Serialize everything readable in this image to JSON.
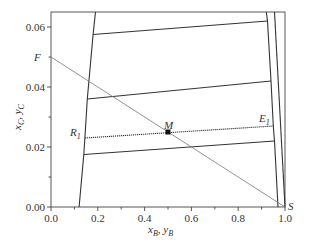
{
  "chart_data": {
    "type": "line",
    "title": "",
    "xlabel": "x_B, y_B",
    "ylabel": "x_C, y_C",
    "xlim": [
      0.0,
      1.0
    ],
    "ylim": [
      0.0,
      0.065
    ],
    "x_ticks": [
      "0.0",
      "0.2",
      "0.4",
      "0.6",
      "0.8",
      "1.0"
    ],
    "y_ticks": [
      "0.00",
      "0.02",
      "0.04",
      "0.06"
    ],
    "grid": false,
    "legend": null,
    "series": [
      {
        "name": "raffinate-boundary",
        "style": "solid",
        "points": [
          [
            0.12,
            0.0
          ],
          [
            0.14,
            0.0175
          ],
          [
            0.145,
            0.023
          ],
          [
            0.155,
            0.036
          ],
          [
            0.18,
            0.0575
          ],
          [
            0.19,
            0.065
          ]
        ]
      },
      {
        "name": "extract-boundary-inner",
        "style": "solid",
        "points": [
          [
            0.97,
            0.0
          ],
          [
            0.955,
            0.022
          ],
          [
            0.95,
            0.027
          ],
          [
            0.94,
            0.042
          ],
          [
            0.925,
            0.062
          ],
          [
            0.92,
            0.065
          ]
        ]
      },
      {
        "name": "extract-boundary-outer",
        "style": "solid",
        "points": [
          [
            1.0,
            0.0
          ],
          [
            0.955,
            0.065
          ]
        ]
      },
      {
        "name": "tie-line-1",
        "style": "solid",
        "points": [
          [
            0.14,
            0.0175
          ],
          [
            0.955,
            0.022
          ]
        ]
      },
      {
        "name": "tie-line-R1-E1",
        "style": "dotted",
        "points": [
          [
            0.145,
            0.023
          ],
          [
            0.95,
            0.027
          ]
        ]
      },
      {
        "name": "tie-line-3",
        "style": "solid",
        "points": [
          [
            0.155,
            0.036
          ],
          [
            0.94,
            0.042
          ]
        ]
      },
      {
        "name": "tie-line-4",
        "style": "solid",
        "points": [
          [
            0.18,
            0.0575
          ],
          [
            0.925,
            0.062
          ]
        ]
      },
      {
        "name": "mixing-line-F-S",
        "style": "thin",
        "points": [
          [
            0.0,
            0.05
          ],
          [
            1.0,
            0.0
          ]
        ]
      }
    ],
    "annotations": [
      {
        "label": "F",
        "x": 0.0,
        "y": 0.05
      },
      {
        "label": "S",
        "x": 1.0,
        "y": 0.0
      },
      {
        "label": "M",
        "x": 0.5,
        "y": 0.025,
        "marker": "square"
      },
      {
        "label": "R1",
        "x": 0.145,
        "y": 0.023
      },
      {
        "label": "E1",
        "x": 0.95,
        "y": 0.027
      }
    ]
  },
  "labels": {
    "xlabel_main": "x",
    "xlabel_sub1": "B",
    "xlabel_sep": ", y",
    "xlabel_sub2": "B",
    "ylabel_main": "x",
    "ylabel_sub1": "C",
    "ylabel_sep": ", y",
    "ylabel_sub2": "C",
    "F": "F",
    "S": "S",
    "M": "M",
    "R": "R",
    "R_sub": "1",
    "E": "E",
    "E_sub": "1"
  }
}
